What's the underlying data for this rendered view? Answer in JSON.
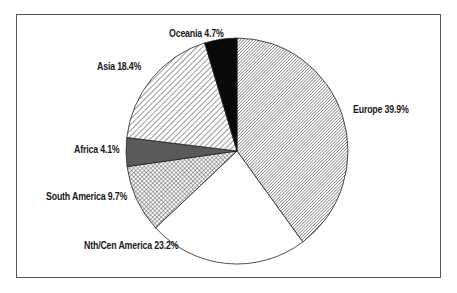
{
  "chart_data": {
    "type": "pie",
    "title": "",
    "start_angle": "12 o'clock, clockwise",
    "categories": [
      "Europe",
      "Nth/Cen America",
      "South America",
      "Africa",
      "Asia",
      "Oceania"
    ],
    "values": [
      39.9,
      23.2,
      9.7,
      4.1,
      18.4,
      4.7
    ],
    "labels": [
      "Europe 39.9%",
      "Nth/Cen America 23.2%",
      "South America 9.7%",
      "Africa 4.1%",
      "Asia 18.4%",
      "Oceania 4.7%"
    ],
    "fills": [
      "fine-diagonal-hatch",
      "white",
      "crosshatch",
      "dark-gray",
      "wide-diagonal-hatch",
      "black"
    ],
    "legend": "none (direct labels)"
  },
  "labels": {
    "europe": "Europe 39.9%",
    "nth_cen_america": "Nth/Cen America 23.2%",
    "south_america": "South America 9.7%",
    "africa": "Africa 4.1%",
    "asia": "Asia 18.4%",
    "oceania": "Oceania 4.7%"
  }
}
